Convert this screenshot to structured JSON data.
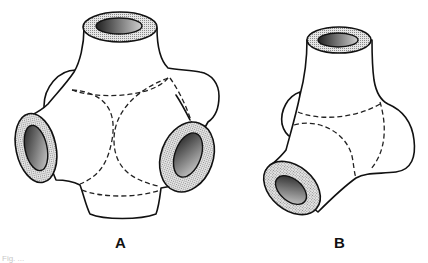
{
  "figure": {
    "panels": [
      {
        "id": "A",
        "label": "A",
        "description": "Six-armed hollow connector (one top, left, right, bottom, plus rear/side lobes) with dashed internal intersection curves",
        "openings": [
          "top",
          "left",
          "right"
        ]
      },
      {
        "id": "B",
        "label": "B",
        "description": "Three-armed hollow connector with top and lower-left openings and a right lobe, dashed internal intersection curves",
        "openings": [
          "top",
          "lower-left"
        ]
      }
    ],
    "caption": "Fig. ..."
  },
  "colors": {
    "stroke": "#111111",
    "background": "#ffffff",
    "ring_fill": "stippled gray",
    "hole_gradient": [
      "#1a1a1a",
      "#d8d8d8"
    ]
  }
}
